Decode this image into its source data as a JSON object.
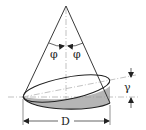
{
  "diagram": {
    "labels": {
      "phi_left": "φ",
      "phi_right": "φ",
      "gamma": "γ",
      "diameter": "D"
    },
    "colors": {
      "stroke": "#222222",
      "dash": "#999999",
      "shade": "#b5b5b5",
      "background": "#ffffff"
    }
  }
}
